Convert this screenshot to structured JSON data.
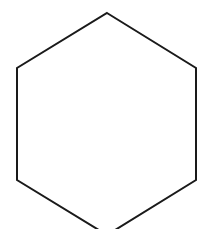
{
  "figure": {
    "shape": "hexagon",
    "orientation": "pointy-top",
    "stroke_color": "#1a1a1a",
    "fill_color": "#ffffff",
    "stroke_width": 2,
    "vertices": [
      [
        107,
        13
      ],
      [
        196,
        68
      ],
      [
        196,
        180
      ],
      [
        107,
        235
      ],
      [
        17,
        180
      ],
      [
        17,
        68
      ]
    ]
  }
}
